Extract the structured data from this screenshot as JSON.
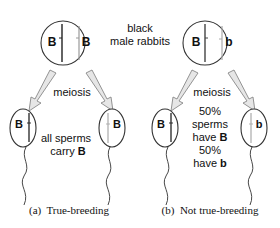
{
  "header": {
    "label_line1": "black",
    "label_line2": "male rabbits"
  },
  "panel_a": {
    "parent_alleles": [
      "B",
      "B"
    ],
    "process": "meiosis",
    "sperm_left_allele": "B",
    "sperm_right_allele": "B",
    "note_line1": "all sperms",
    "note_line2_prefix": "carry ",
    "note_line2_allele": "B",
    "caption": "(a)  True-breeding"
  },
  "panel_b": {
    "parent_alleles": [
      "B",
      "b"
    ],
    "process": "meiosis",
    "sperm_left_allele": "B",
    "sperm_right_allele": "b",
    "note_line1": "50%",
    "note_line2": "sperms",
    "note_line3_prefix": "have ",
    "note_line3_allele": "B",
    "note_line4": "50%",
    "note_line5_prefix": "have ",
    "note_line5_allele": "b",
    "caption": "(b)  Not true-breeding"
  },
  "colors": {
    "outline": "#333333",
    "chromosome_dark": "#222222",
    "chromosome_light": "#aaaaaa",
    "arrow_fill": "#e6e6e6",
    "arrow_stroke": "#888888",
    "text": "#111111"
  }
}
